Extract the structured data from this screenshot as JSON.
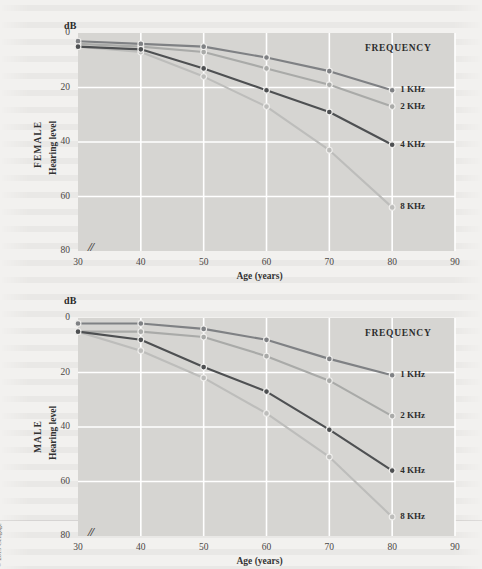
{
  "figure": {
    "copyright": "© 2019 Cengage",
    "background_color": "#f2f1ef",
    "plot_background_color": "#d6d5d2",
    "gridline_color": "#ffffff"
  },
  "panels": [
    {
      "id": "female",
      "group_label": "FEMALE",
      "y_axis_label": "Hearing level",
      "y_axis_unit": "dB",
      "x_axis_title": "Age (years)",
      "axis_break_symbol": "//",
      "legend_title": "FREQUENCY",
      "y_ticks": [
        "0",
        "20",
        "40",
        "60",
        "80"
      ],
      "x_ticks": [
        "30",
        "40",
        "50",
        "60",
        "70",
        "80",
        "90"
      ],
      "series_labels": [
        "1 KHz",
        "2 KHz",
        "4 KHz",
        "8 KHz"
      ]
    },
    {
      "id": "male",
      "group_label": "MALE",
      "y_axis_label": "Hearing level",
      "y_axis_unit": "dB",
      "x_axis_title": "Age (years)",
      "axis_break_symbol": "//",
      "legend_title": "FREQUENCY",
      "y_ticks": [
        "0",
        "20",
        "40",
        "60",
        "80"
      ],
      "x_ticks": [
        "30",
        "40",
        "50",
        "60",
        "70",
        "80",
        "90"
      ],
      "series_labels": [
        "1 KHz",
        "2 KHz",
        "4 KHz",
        "8 KHz"
      ]
    }
  ],
  "chart_data": [
    {
      "type": "line",
      "title": "FEMALE",
      "xlabel": "Age (years)",
      "ylabel": "Hearing level",
      "yunit": "dB",
      "x": [
        30,
        40,
        50,
        60,
        70,
        80
      ],
      "xlim": [
        30,
        90
      ],
      "ylim": [
        0,
        80
      ],
      "y_inverted": true,
      "grid": true,
      "legend_title": "FREQUENCY",
      "legend_position": "right-inside",
      "series": [
        {
          "name": "1 KHz",
          "color": "#7f8184",
          "values": [
            3,
            4,
            5,
            9,
            14,
            21
          ]
        },
        {
          "name": "2 KHz",
          "color": "#a9aaa8",
          "values": [
            4,
            5,
            7,
            13,
            19,
            27
          ]
        },
        {
          "name": "4 KHz",
          "color": "#4e5052",
          "values": [
            5,
            6,
            13,
            21,
            29,
            41
          ]
        },
        {
          "name": "8 KHz",
          "color": "#bdbdbb",
          "values": [
            5,
            7,
            16,
            27,
            43,
            64
          ]
        }
      ]
    },
    {
      "type": "line",
      "title": "MALE",
      "xlabel": "Age (years)",
      "ylabel": "Hearing level",
      "yunit": "dB",
      "x": [
        30,
        40,
        50,
        60,
        70,
        80
      ],
      "xlim": [
        30,
        90
      ],
      "ylim": [
        0,
        80
      ],
      "y_inverted": true,
      "grid": true,
      "legend_title": "FREQUENCY",
      "legend_position": "right-inside",
      "series": [
        {
          "name": "1 KHz",
          "color": "#7f8184",
          "values": [
            2,
            2,
            4,
            8,
            15,
            21
          ]
        },
        {
          "name": "2 KHz",
          "color": "#a9aaa8",
          "values": [
            5,
            5,
            7,
            14,
            23,
            36
          ]
        },
        {
          "name": "4 KHz",
          "color": "#4e5052",
          "values": [
            5,
            8,
            18,
            27,
            41,
            56
          ]
        },
        {
          "name": "8 KHz",
          "color": "#bdbdbb",
          "values": [
            5,
            12,
            22,
            35,
            51,
            73
          ]
        }
      ]
    }
  ]
}
